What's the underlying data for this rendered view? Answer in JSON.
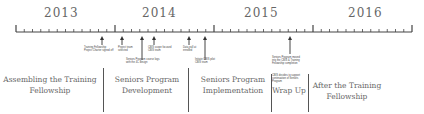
{
  "years": [
    "2013",
    "2014",
    "2015",
    "2016"
  ],
  "milestones": [
    {
      "label": "Training Fellowship Project Charter signed off"
    },
    {
      "label": "Project team selected"
    },
    {
      "label": "Seniors Program course logs with the 4C design"
    },
    {
      "label": "CBIS scope focused CBIS team"
    },
    {
      "label": "Data pull at enrolled"
    },
    {
      "label": "Initiate CBIS pilot CBIS team"
    },
    {
      "label": "Seniors Program moved into the CBIS & Training Fellowship completion"
    },
    {
      "label": "CBIS decides to support continuation of Seniors Program"
    }
  ],
  "phases": [
    {
      "label": "Assembling the Training Fellowship"
    },
    {
      "label": "Seniors Program Development"
    },
    {
      "label": "Seniors Program Implementation"
    },
    {
      "label": "Wrap Up"
    },
    {
      "label": "After the Training Fellowship"
    }
  ]
}
